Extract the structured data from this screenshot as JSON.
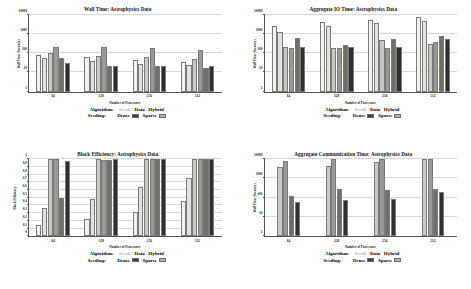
{
  "figure": {
    "dataset": "Astrophysics Data",
    "xlabel": "Number of Processors",
    "categories": [
      "64",
      "128",
      "256",
      "512"
    ]
  },
  "legend": {
    "algorithm_heading": "Algorithm:",
    "seeding_heading": "Seeding:",
    "algorithms": [
      {
        "label": "Seeds",
        "muted": true
      },
      {
        "label": "Data",
        "muted": false
      },
      {
        "label": "Hybrid",
        "muted": false
      }
    ],
    "seedings": [
      {
        "label": "Dense",
        "color": "#3a3a3a"
      },
      {
        "label": "Sparse",
        "color": "#b0b0b0"
      }
    ]
  },
  "series_colors": {
    "seeds_dense": "#f2f2f0",
    "seeds_sparse": "#e2e2de",
    "data_dense": "#c9c9c4",
    "data_sparse": "#9a9a95",
    "hybrid_dense": "#6e6e6b",
    "hybrid_sparse": "#2f2f2d"
  },
  "chart_data": [
    {
      "type": "bar",
      "title": "Wall Time: Astrophysics Data",
      "xlabel": "Number of Processors",
      "ylabel": "Wall Time (Seconds)",
      "yscale": "log",
      "ylim": [
        1,
        10000
      ],
      "yticks": [
        1,
        10,
        100,
        1000,
        10000
      ],
      "ytick_labels": [
        "1",
        "10",
        "100",
        "1000",
        "10000"
      ],
      "grid": true,
      "categories": [
        "64",
        "128",
        "256",
        "512"
      ],
      "series": [
        {
          "name": "Seeds Dense",
          "values": [
            78,
            62,
            42,
            34
          ]
        },
        {
          "name": "Seeds Sparse",
          "values": [
            58,
            40,
            28,
            24
          ]
        },
        {
          "name": "Data Dense",
          "values": [
            105,
            72,
            62,
            48
          ]
        },
        {
          "name": "Data Sparse",
          "values": [
            210,
            200,
            198,
            150
          ]
        },
        {
          "name": "Hybrid Dense",
          "values": [
            55,
            21,
            21,
            18
          ]
        },
        {
          "name": "Hybrid Sparse",
          "values": [
            32,
            21,
            21,
            22
          ]
        }
      ]
    },
    {
      "type": "bar",
      "title": "Aggregate IO Time: Astrophysics Data",
      "xlabel": "Number of Processors",
      "ylabel": "Wall Time (Seconds)",
      "yscale": "log",
      "ylim": [
        1,
        10000
      ],
      "yticks": [
        1,
        10,
        100,
        1000,
        10000
      ],
      "ytick_labels": [
        "1",
        "10",
        "100",
        "1000",
        "10000"
      ],
      "grid": true,
      "categories": [
        "64",
        "128",
        "256",
        "512"
      ],
      "series": [
        {
          "name": "Seeds Dense",
          "values": [
            2600,
            4200,
            5600,
            8000
          ]
        },
        {
          "name": "Seeds Sparse",
          "values": [
            1200,
            2600,
            3600,
            4600
          ]
        },
        {
          "name": "Data Dense",
          "values": [
            200,
            190,
            500,
            300
          ]
        },
        {
          "name": "Data Sparse",
          "values": [
            195,
            185,
            190,
            400
          ]
        },
        {
          "name": "Hybrid Dense",
          "values": [
            600,
            280,
            520,
            800
          ]
        },
        {
          "name": "Hybrid Sparse",
          "values": [
            205,
            205,
            205,
            560
          ]
        }
      ]
    },
    {
      "type": "bar",
      "title": "Block Efficiency: Astrophysics Data",
      "xlabel": "Number of Processors",
      "ylabel": "Block Efficiency",
      "yscale": "linear",
      "ylim": [
        0,
        1
      ],
      "yticks": [
        0,
        0.1,
        0.2,
        0.3,
        0.4,
        0.5,
        0.6,
        0.7,
        0.8,
        0.9,
        1
      ],
      "ytick_labels": [
        "0",
        "0.1",
        "0.2",
        "0.3",
        "0.4",
        "0.5",
        "0.6",
        "0.7",
        "0.8",
        "0.9",
        "1"
      ],
      "grid": true,
      "categories": [
        "64",
        "128",
        "256",
        "512"
      ],
      "series": [
        {
          "name": "Seeds Dense",
          "values": [
            0.15,
            0.23,
            0.32,
            0.46
          ]
        },
        {
          "name": "Seeds Sparse",
          "values": [
            0.37,
            0.48,
            0.64,
            0.75
          ]
        },
        {
          "name": "Data Dense",
          "values": [
            1.0,
            1.0,
            1.0,
            1.0
          ]
        },
        {
          "name": "Data Sparse",
          "values": [
            1.0,
            0.99,
            1.0,
            1.0
          ]
        },
        {
          "name": "Hybrid Dense",
          "values": [
            0.5,
            0.99,
            1.0,
            1.0
          ]
        },
        {
          "name": "Hybrid Sparse",
          "values": [
            0.98,
            1.0,
            1.0,
            1.0
          ]
        }
      ]
    },
    {
      "type": "bar",
      "title": "Aggregate Communication Time: Astrophysics Data",
      "xlabel": "Number of Processors",
      "ylabel": "Wall Time (Seconds)",
      "yscale": "log",
      "ylim": [
        1,
        10000
      ],
      "yticks": [
        1,
        10,
        100,
        1000,
        10000
      ],
      "ytick_labels": [
        "1",
        "10",
        "100",
        "1000",
        "10000"
      ],
      "grid": true,
      "categories": [
        "64",
        "128",
        "256",
        "512"
      ],
      "series": [
        {
          "name": "Data Dense",
          "values": [
            3800,
            4200,
            6800,
            10000
          ]
        },
        {
          "name": "Data Sparse",
          "values": [
            8500,
            13000,
            15000,
            17000
          ]
        },
        {
          "name": "Hybrid Dense",
          "values": [
            130,
            300,
            260,
            300
          ]
        },
        {
          "name": "Hybrid Sparse",
          "values": [
            60,
            75,
            90,
            190
          ]
        }
      ]
    }
  ]
}
